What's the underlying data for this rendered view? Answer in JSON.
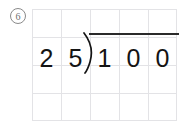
{
  "worksheet": {
    "problem_number": "6",
    "problem_number_display": "⁶",
    "problem_type": "long-division",
    "expression": "25)100",
    "divisor": "25",
    "dividend": "100",
    "divisor_digits": [
      "2",
      "5"
    ],
    "dividend_digits": [
      "1",
      "0",
      "0"
    ]
  },
  "grid": {
    "columns": 5,
    "rows": 4,
    "cell_width": 29,
    "cell_height": 28,
    "line_color": "#e3e3e6"
  },
  "colors": {
    "ink": "#141414",
    "bar": "#2a2a2a",
    "grid": "#e3e3e6",
    "problem_number": "#6f6f6f",
    "background": "#ffffff"
  },
  "icons": {
    "division_bracket": "division-bracket"
  }
}
